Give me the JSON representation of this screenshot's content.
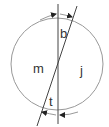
{
  "diagram": {
    "type": "circle-with-intersecting-lines",
    "labels": {
      "top": "b",
      "left": "m",
      "right": "j",
      "bottom": "t"
    },
    "colors": {
      "circle": "#999999",
      "lines": "#444444",
      "text": "#333333"
    }
  }
}
